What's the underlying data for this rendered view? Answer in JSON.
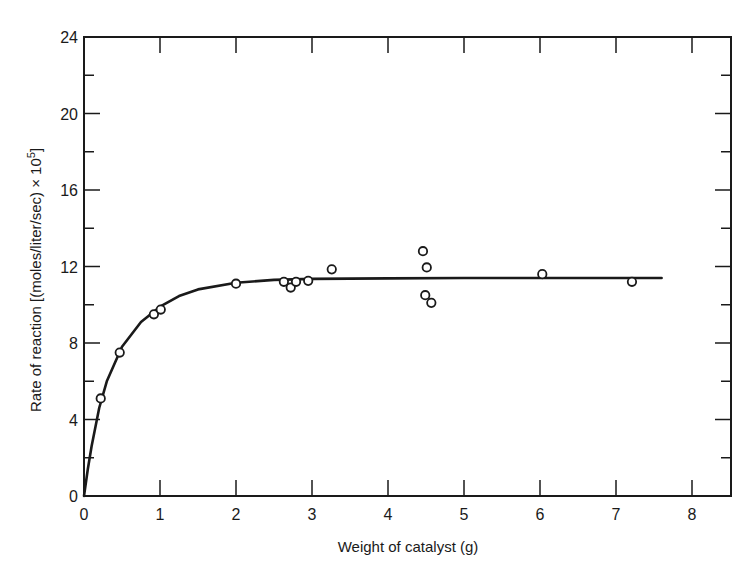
{
  "chart_data": {
    "type": "scatter",
    "title": "",
    "xlabel": "Weight of catalyst (g)",
    "ylabel": "Rate of reaction [(moles/liter/sec) × 10",
    "ylabel_superscript": "5",
    "ylabel_close": "]",
    "xlim": [
      0,
      8.5
    ],
    "ylim": [
      0,
      24
    ],
    "x_ticks": [
      0,
      1,
      2,
      3,
      4,
      5,
      6,
      7,
      8
    ],
    "y_ticks": [
      0,
      4,
      8,
      12,
      16,
      20,
      24
    ],
    "grid": false,
    "legend": null,
    "series": [
      {
        "name": "Measured data",
        "marker": "open-circle",
        "points": [
          {
            "x": 0.22,
            "y": 5.1
          },
          {
            "x": 0.47,
            "y": 7.5
          },
          {
            "x": 0.92,
            "y": 9.5
          },
          {
            "x": 1.01,
            "y": 9.75
          },
          {
            "x": 2.0,
            "y": 11.1
          },
          {
            "x": 2.63,
            "y": 11.2
          },
          {
            "x": 2.72,
            "y": 10.9
          },
          {
            "x": 2.79,
            "y": 11.2
          },
          {
            "x": 2.95,
            "y": 11.25
          },
          {
            "x": 3.26,
            "y": 11.85
          },
          {
            "x": 4.46,
            "y": 12.8
          },
          {
            "x": 4.51,
            "y": 11.95
          },
          {
            "x": 4.49,
            "y": 10.5
          },
          {
            "x": 4.57,
            "y": 10.1
          },
          {
            "x": 6.03,
            "y": 11.6
          },
          {
            "x": 7.21,
            "y": 11.2
          }
        ]
      },
      {
        "name": "Fitted curve",
        "style": "solid-line",
        "points": [
          {
            "x": 0.0,
            "y": 0.0
          },
          {
            "x": 0.05,
            "y": 1.4
          },
          {
            "x": 0.1,
            "y": 2.6
          },
          {
            "x": 0.2,
            "y": 4.6
          },
          {
            "x": 0.3,
            "y": 6.0
          },
          {
            "x": 0.5,
            "y": 7.8
          },
          {
            "x": 0.75,
            "y": 9.1
          },
          {
            "x": 1.0,
            "y": 9.9
          },
          {
            "x": 1.25,
            "y": 10.45
          },
          {
            "x": 1.5,
            "y": 10.8
          },
          {
            "x": 2.0,
            "y": 11.15
          },
          {
            "x": 2.5,
            "y": 11.3
          },
          {
            "x": 3.0,
            "y": 11.35
          },
          {
            "x": 4.0,
            "y": 11.38
          },
          {
            "x": 5.0,
            "y": 11.4
          },
          {
            "x": 6.0,
            "y": 11.4
          },
          {
            "x": 7.0,
            "y": 11.4
          },
          {
            "x": 7.6,
            "y": 11.4
          }
        ]
      }
    ]
  },
  "colors": {
    "ink": "#1a1a1a",
    "background": "#ffffff"
  }
}
